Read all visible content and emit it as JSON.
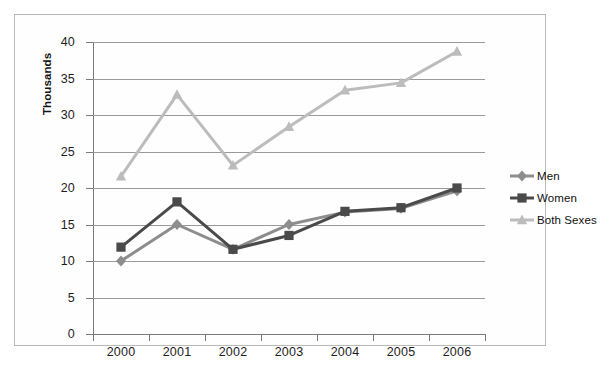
{
  "chart_data": {
    "type": "line",
    "title": "",
    "xlabel": "",
    "ylabel": "Thousands",
    "categories": [
      "2000",
      "2001",
      "2002",
      "2003",
      "2004",
      "2005",
      "2006"
    ],
    "x": [
      2000,
      2001,
      2002,
      2003,
      2004,
      2005,
      2006
    ],
    "ylim": [
      0,
      40
    ],
    "yticks": [
      0,
      5,
      10,
      15,
      20,
      25,
      30,
      35,
      40
    ],
    "ytick_labels": [
      "0",
      "5",
      "10",
      "15",
      "20",
      "25",
      "30",
      "35",
      "40"
    ],
    "grid": true,
    "legend_position": "right",
    "series": [
      {
        "name": "Men",
        "marker": "diamond",
        "color": "#8d8d8d",
        "values": [
          10.0,
          15.0,
          11.6,
          15.0,
          16.7,
          17.2,
          19.6
        ]
      },
      {
        "name": "Women",
        "marker": "square",
        "color": "#4a4a4a",
        "values": [
          11.9,
          18.1,
          11.6,
          13.5,
          16.8,
          17.3,
          20.0
        ]
      },
      {
        "name": "Both Sexes",
        "marker": "triangle",
        "color": "#bcbcbc",
        "values": [
          21.6,
          32.8,
          23.1,
          28.4,
          33.4,
          34.4,
          38.7
        ]
      }
    ]
  },
  "legend": {
    "items": [
      {
        "label": "Men"
      },
      {
        "label": "Women"
      },
      {
        "label": "Both Sexes"
      }
    ]
  },
  "axis": {
    "y_title": "Thousands"
  }
}
